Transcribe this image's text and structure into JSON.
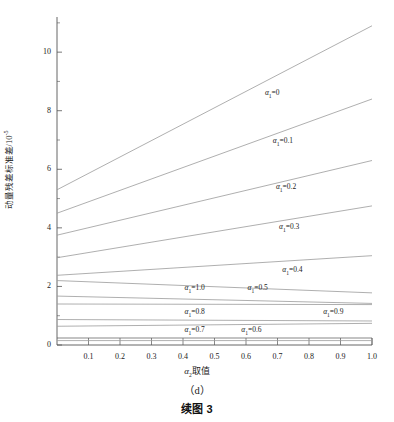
{
  "figure": {
    "panel_id": "（d）",
    "caption": "续图 3"
  },
  "axes": {
    "ylabel_text": "动量残差标准差/10",
    "ylabel_exponent": "-5",
    "xlabel_alpha": "α",
    "xlabel_sub": "2",
    "xlabel_rest": "取值",
    "y_ticks": [
      "0",
      "2",
      "4",
      "6",
      "8",
      "10"
    ],
    "x_ticks": [
      "0.1",
      "0.2",
      "0.3",
      "0.4",
      "0.5",
      "0.6",
      "0.7",
      "0.8",
      "0.9",
      "1.0"
    ]
  },
  "chart_data": {
    "type": "line",
    "title": "",
    "xlabel": "α2取值",
    "ylabel": "动量残差标准差/10^-5",
    "xlim": [
      0.0,
      1.0
    ],
    "ylim": [
      0.0,
      11.2
    ],
    "grid": false,
    "legend": "inline-labels",
    "x": [
      0.0,
      1.0
    ],
    "series": [
      {
        "name": "α1=0",
        "label": "α₁=0",
        "values": [
          5.3,
          10.9
        ],
        "label_x": 0.66,
        "label_y": 8.6
      },
      {
        "name": "α1=0.1",
        "label": "α₁=0.1",
        "values": [
          4.5,
          8.4
        ],
        "label_x": 0.685,
        "label_y": 6.95
      },
      {
        "name": "α1=0.2",
        "label": "α₁=0.2",
        "values": [
          3.75,
          6.3
        ],
        "label_x": 0.695,
        "label_y": 5.38
      },
      {
        "name": "α1=0.3",
        "label": "α₁=0.3",
        "values": [
          2.98,
          4.75
        ],
        "label_x": 0.705,
        "label_y": 4.04
      },
      {
        "name": "α1=0.4",
        "label": "α₁=0.4",
        "values": [
          2.38,
          3.05
        ],
        "label_x": 0.715,
        "label_y": 2.56
      },
      {
        "name": "α1=1.0",
        "label": "α₁=1.0",
        "values": [
          2.2,
          1.78
        ],
        "label_x": 0.405,
        "label_y": 1.93
      },
      {
        "name": "α1=0.5",
        "label": "α₁=0.5",
        "values": [
          1.67,
          1.42
        ],
        "label_x": 0.605,
        "label_y": 1.93
      },
      {
        "name": "α1=0.9",
        "label": "α₁=0.9",
        "values": [
          1.4,
          1.38
        ],
        "label_x": 0.845,
        "label_y": 1.12
      },
      {
        "name": "α1=0.8",
        "label": "α₁=0.8",
        "values": [
          0.87,
          0.82
        ],
        "label_x": 0.405,
        "label_y": 1.12
      },
      {
        "name": "α1=0.6",
        "label": "α₁=0.6",
        "values": [
          0.64,
          0.74
        ],
        "label_x": 0.585,
        "label_y": 0.52
      },
      {
        "name": "α1=0.7",
        "label": "α₁=0.7",
        "values": [
          0.15,
          0.15
        ],
        "label_x": 0.405,
        "label_y": 0.52
      }
    ],
    "series_color": "#9a9a9a",
    "axis_color": "#555555"
  }
}
